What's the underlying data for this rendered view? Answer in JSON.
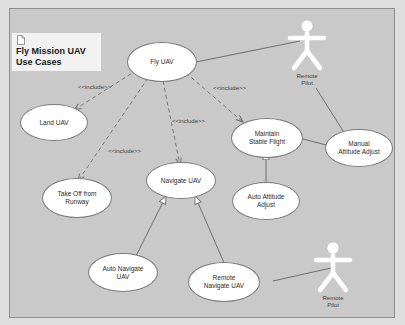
{
  "diagram": {
    "title": "Fly Mission UAV\nUse Cases",
    "title_icon": "document-icon",
    "canvas_color": "#c9c9c9",
    "node_fill": "#ffffff",
    "line_color": "#6e6e6e"
  },
  "use_cases": [
    {
      "id": "fly-uav",
      "label": "Fly UAV"
    },
    {
      "id": "land-uav",
      "label": "Land UAV"
    },
    {
      "id": "take-off-runway",
      "label": "Take Off from\nRunway"
    },
    {
      "id": "navigate-uav",
      "label": "Navigate UAV"
    },
    {
      "id": "maintain-stable-flight",
      "label": "Maintain\nStable Flight"
    },
    {
      "id": "manual-attitude-adjust",
      "label": "Manual\nAttitude Adjust"
    },
    {
      "id": "auto-attitude-adjust",
      "label": "Auto Attitude\nAdjust"
    },
    {
      "id": "auto-navigate-uav",
      "label": "Auto Navigate\nUAV"
    },
    {
      "id": "remote-navigate-uav",
      "label": "Remote\nNavigate UAV"
    }
  ],
  "actors": [
    {
      "id": "remote-pilot-top",
      "label": "Remote\nPilot"
    },
    {
      "id": "remote-pilot-bottom",
      "label": "Remote\nPilot"
    }
  ],
  "relations": {
    "include_label": "<<include>>",
    "include_labels": [
      "<<include>>",
      "<<include>>",
      "<<include>>",
      "<<include>>"
    ],
    "include_edges": [
      {
        "from": "fly-uav",
        "to": "land-uav"
      },
      {
        "from": "fly-uav",
        "to": "take-off-runway"
      },
      {
        "from": "fly-uav",
        "to": "navigate-uav"
      },
      {
        "from": "fly-uav",
        "to": "maintain-stable-flight"
      }
    ],
    "generalization_edges": [
      {
        "from": "manual-attitude-adjust",
        "to": "maintain-stable-flight"
      },
      {
        "from": "auto-attitude-adjust",
        "to": "maintain-stable-flight"
      },
      {
        "from": "auto-navigate-uav",
        "to": "navigate-uav"
      },
      {
        "from": "remote-navigate-uav",
        "to": "navigate-uav"
      }
    ],
    "association_edges": [
      {
        "from": "fly-uav",
        "to": "remote-pilot-top"
      },
      {
        "from": "manual-attitude-adjust",
        "to": "remote-pilot-top"
      },
      {
        "from": "remote-navigate-uav",
        "to": "remote-pilot-bottom"
      }
    ]
  }
}
